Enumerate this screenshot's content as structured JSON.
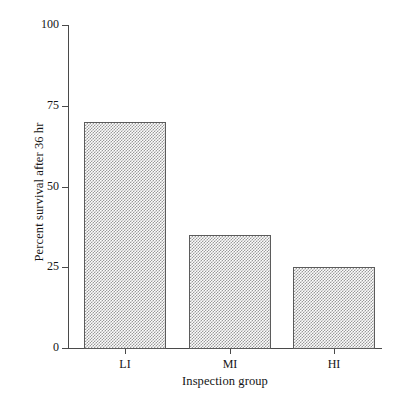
{
  "chart_data": {
    "type": "bar",
    "title": "",
    "categories": [
      "LI",
      "MI",
      "HI"
    ],
    "values": [
      70,
      35,
      25
    ],
    "xlabel": "Inspection group",
    "ylabel": "Percent survival after 36 hr",
    "ylim": [
      0,
      100
    ],
    "yticks": [
      0,
      25,
      50,
      75,
      100
    ],
    "ytick_labels": [
      "0",
      "25",
      "50",
      "75",
      "100"
    ],
    "grid": false,
    "legend": null,
    "bar_fill": "#9a9a9a",
    "bar_edge": "#5b5b5b",
    "axis_color": "#4a4a4a",
    "background": "#ffffff"
  },
  "axis": {
    "y_label": "Percent survival after 36 hr",
    "x_label": "Inspection group",
    "y_ticks": [
      {
        "value": 100,
        "label": "100"
      },
      {
        "value": 75,
        "label": "75"
      },
      {
        "value": 50,
        "label": "50"
      },
      {
        "value": 25,
        "label": "25"
      },
      {
        "value": 0,
        "label": "0"
      }
    ],
    "x_ticks": [
      {
        "label": "LI"
      },
      {
        "label": "MI"
      },
      {
        "label": "HI"
      }
    ]
  },
  "bars": [
    {
      "category": "LI",
      "value": 70
    },
    {
      "category": "MI",
      "value": 35
    },
    {
      "category": "HI",
      "value": 25
    }
  ]
}
